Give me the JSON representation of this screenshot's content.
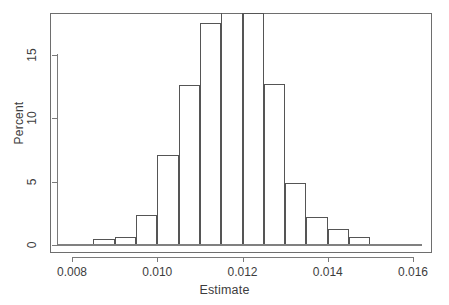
{
  "figure": {
    "background_color": "#ffffff",
    "frame_color": "#6e6e6e",
    "bar_border_color": "#555555",
    "text_color": "#3d3d3d"
  },
  "chart_data": {
    "type": "bar",
    "subtype": "histogram",
    "title": "",
    "xlabel": "Estimate",
    "ylabel": "Percent",
    "xlim": [
      0.0077,
      0.0163
    ],
    "ylim": [
      0,
      19.2
    ],
    "grid": false,
    "legend": null,
    "bin_width": 0.0005,
    "x_tick_labels": [
      "0.008",
      "0.010",
      "0.012",
      "0.014",
      "0.016"
    ],
    "x_tick_values": [
      0.008,
      0.01,
      0.012,
      0.014,
      0.016
    ],
    "y_tick_labels": [
      "0",
      "5",
      "10",
      "15"
    ],
    "y_tick_values": [
      0,
      5,
      10,
      15
    ],
    "bins": [
      {
        "left": 0.0085,
        "right": 0.009,
        "value": 0.5
      },
      {
        "left": 0.009,
        "right": 0.0095,
        "value": 0.6
      },
      {
        "left": 0.0095,
        "right": 0.01,
        "value": 2.4
      },
      {
        "left": 0.01,
        "right": 0.0105,
        "value": 7.1
      },
      {
        "left": 0.0105,
        "right": 0.011,
        "value": 12.6
      },
      {
        "left": 0.011,
        "right": 0.0115,
        "value": 17.5
      },
      {
        "left": 0.0115,
        "right": 0.012,
        "value": 18.7
      },
      {
        "left": 0.012,
        "right": 0.0125,
        "value": 18.3
      },
      {
        "left": 0.0125,
        "right": 0.013,
        "value": 12.7
      },
      {
        "left": 0.013,
        "right": 0.0135,
        "value": 4.9
      },
      {
        "left": 0.0135,
        "right": 0.014,
        "value": 2.2
      },
      {
        "left": 0.014,
        "right": 0.0145,
        "value": 1.3
      },
      {
        "left": 0.0145,
        "right": 0.015,
        "value": 0.6
      },
      {
        "left": 0.015,
        "right": 0.0155,
        "value": 0.1
      }
    ],
    "categories": [
      "0.00875",
      "0.00925",
      "0.00975",
      "0.01025",
      "0.01075",
      "0.01125",
      "0.01175",
      "0.01225",
      "0.01275",
      "0.01325",
      "0.01375",
      "0.01425",
      "0.01475",
      "0.01525"
    ],
    "values": [
      0.5,
      0.6,
      2.4,
      7.1,
      12.6,
      17.5,
      18.7,
      18.3,
      12.7,
      4.9,
      2.2,
      1.3,
      0.6,
      0.1
    ]
  }
}
